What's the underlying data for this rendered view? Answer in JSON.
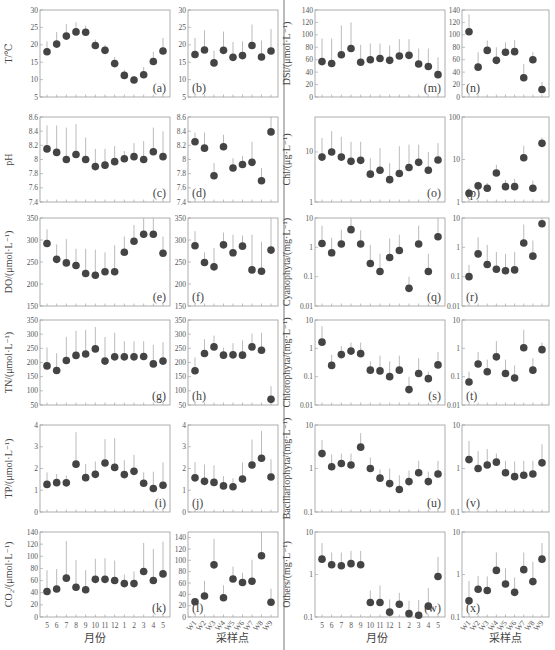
{
  "figure": {
    "left_xlabel": "月份",
    "right_xlabel": "采样点",
    "months": [
      "5",
      "6",
      "7",
      "8",
      "9",
      "10",
      "11",
      "12",
      "1",
      "2",
      "3",
      "4",
      "5"
    ],
    "sites": [
      "W1",
      "W2",
      "W3",
      "W4",
      "W5",
      "W6",
      "W7",
      "W8",
      "W9"
    ]
  },
  "chart_data": [
    {
      "id": "a",
      "type": "scatter",
      "label": "(a)",
      "ylabel": "T/℃",
      "scale": "linear",
      "ylim": [
        5,
        30
      ],
      "yticks": [
        5,
        10,
        15,
        20,
        25,
        30
      ],
      "xaxis": "months",
      "values": [
        18,
        20.2,
        22.5,
        23.7,
        23.6,
        19.8,
        18.4,
        14.6,
        11.2,
        9.9,
        11.4,
        15.2,
        18.2
      ],
      "upper": [
        21,
        23.7,
        26,
        26.5,
        25.5,
        21.5,
        20,
        16.5,
        12.8,
        11,
        13.6,
        18,
        22
      ]
    },
    {
      "id": "b",
      "type": "scatter",
      "label": "(b)",
      "ylabel": "",
      "scale": "linear",
      "ylim": [
        5,
        30
      ],
      "yticks": [
        5,
        10,
        15,
        20,
        25,
        30
      ],
      "xaxis": "sites",
      "values": [
        17.2,
        18.5,
        14.8,
        18.4,
        16.4,
        16.9,
        19.8,
        16.5,
        18.2
      ],
      "upper": [
        22,
        24.2,
        18.3,
        23.8,
        20.8,
        21,
        25.8,
        21.2,
        24.5
      ]
    },
    {
      "id": "c",
      "type": "scatter",
      "label": "(c)",
      "ylabel": "pH",
      "scale": "linear",
      "ylim": [
        7.4,
        8.6
      ],
      "yticks": [
        "7.4",
        "7.6",
        "7.8",
        "8",
        "8.2",
        "8.4",
        "8.6"
      ],
      "xaxis": "months",
      "values": [
        8.15,
        8.1,
        8.0,
        8.07,
        8.0,
        7.9,
        7.92,
        7.97,
        8.01,
        8.04,
        8.0,
        8.11,
        8.04
      ],
      "upper": [
        8.48,
        8.48,
        8.45,
        8.5,
        8.31,
        8.15,
        8.15,
        8.19,
        8.12,
        8.23,
        8.26,
        8.45,
        8.4
      ]
    },
    {
      "id": "d",
      "type": "scatter",
      "label": "(d)",
      "ylabel": "",
      "scale": "linear",
      "ylim": [
        7.4,
        8.6
      ],
      "yticks": [
        "7.4",
        "7.6",
        "7.8",
        "8",
        "8.2",
        "8.4",
        "8.6"
      ],
      "xaxis": "sites",
      "values": [
        8.25,
        8.16,
        7.77,
        8.18,
        7.88,
        7.93,
        7.96,
        7.7,
        8.39
      ],
      "upper": [
        8.38,
        8.38,
        7.95,
        8.35,
        8.02,
        8.05,
        8.25,
        7.88,
        8.6
      ]
    },
    {
      "id": "e",
      "type": "scatter",
      "label": "(e)",
      "ylabel": "DO/(μmol·L⁻¹)",
      "scale": "linear",
      "ylim": [
        150,
        350
      ],
      "yticks": [
        150,
        200,
        250,
        300,
        350
      ],
      "xaxis": "months",
      "values": [
        292,
        256,
        248,
        242,
        224,
        220,
        228,
        228,
        272,
        297,
        313,
        313,
        270
      ],
      "upper": [
        324,
        290,
        302,
        280,
        280,
        278,
        272,
        288,
        308,
        334,
        352,
        360,
        308
      ]
    },
    {
      "id": "f",
      "type": "scatter",
      "label": "(f)",
      "ylabel": "",
      "scale": "linear",
      "ylim": [
        150,
        350
      ],
      "yticks": [
        150,
        200,
        250,
        300,
        350
      ],
      "xaxis": "sites",
      "values": [
        287,
        249,
        239,
        289,
        271,
        286,
        232,
        229,
        277
      ],
      "upper": [
        320,
        272,
        282,
        317,
        312,
        310,
        312,
        296,
        352
      ]
    },
    {
      "id": "g",
      "type": "scatter",
      "label": "(g)",
      "ylabel": "TN/(μmol·L⁻¹)",
      "scale": "linear",
      "ylim": [
        50,
        350
      ],
      "yticks": [
        50,
        100,
        150,
        200,
        250,
        300,
        350
      ],
      "xaxis": "months",
      "values": [
        188,
        172,
        207,
        225,
        230,
        248,
        205,
        220,
        220,
        220,
        221,
        195,
        205
      ],
      "upper": [
        253,
        233,
        290,
        312,
        315,
        325,
        290,
        305,
        275,
        275,
        275,
        262,
        272
      ]
    },
    {
      "id": "h",
      "type": "scatter",
      "label": "(h)",
      "ylabel": "",
      "scale": "linear",
      "ylim": [
        50,
        350
      ],
      "yticks": [
        50,
        100,
        150,
        200,
        250,
        300,
        350
      ],
      "xaxis": "sites",
      "values": [
        171,
        232,
        255,
        226,
        227,
        226,
        255,
        243,
        70
      ],
      "upper": [
        218,
        282,
        295,
        252,
        268,
        278,
        302,
        305,
        116
      ]
    },
    {
      "id": "i",
      "type": "scatter",
      "label": "(i)",
      "ylabel": "TP/(μmol·L⁻¹)",
      "scale": "linear",
      "ylim": [
        0,
        4
      ],
      "yticks": [
        0,
        1,
        2,
        3,
        4
      ],
      "xaxis": "months",
      "values": [
        1.27,
        1.35,
        1.34,
        2.2,
        1.58,
        1.73,
        2.25,
        2.05,
        1.72,
        1.87,
        1.32,
        1.08,
        1.23
      ],
      "upper": [
        1.82,
        1.75,
        1.68,
        3.67,
        2.2,
        2.32,
        3.35,
        3.4,
        2.38,
        2.63,
        1.82,
        1.85,
        2.28
      ]
    },
    {
      "id": "j",
      "type": "scatter",
      "label": "(j)",
      "ylabel": "",
      "scale": "linear",
      "ylim": [
        0,
        4
      ],
      "yticks": [
        0,
        1,
        2,
        3,
        4
      ],
      "xaxis": "sites",
      "values": [
        1.57,
        1.41,
        1.36,
        1.2,
        1.16,
        1.52,
        2.16,
        2.47,
        1.61
      ],
      "upper": [
        2.3,
        2.18,
        2.15,
        1.65,
        1.55,
        2.27,
        3.33,
        3.72,
        2.43
      ]
    },
    {
      "id": "k",
      "type": "scatter",
      "label": "(k)",
      "ylabel": "CO₂/(μmol·L⁻¹)",
      "scale": "linear",
      "ylim": [
        0,
        140
      ],
      "yticks": [
        0,
        20,
        40,
        60,
        80,
        100,
        120,
        140
      ],
      "xaxis": "months",
      "values": [
        42,
        46,
        64,
        49,
        45,
        62,
        62,
        60,
        55,
        55,
        75,
        60,
        71
      ],
      "upper": [
        77,
        79,
        125,
        94,
        77,
        96,
        97,
        93,
        70,
        75,
        122,
        112,
        124
      ]
    },
    {
      "id": "l",
      "type": "scatter",
      "label": "(l)",
      "ylabel": "",
      "scale": "linear",
      "ylim": [
        0,
        150
      ],
      "yticks": [
        0,
        20,
        40,
        60,
        80,
        100,
        120,
        140
      ],
      "xaxis": "sites",
      "values": [
        27,
        37,
        92,
        34,
        67,
        61,
        63,
        108,
        26
      ],
      "upper": [
        33,
        64,
        138,
        56,
        89,
        78,
        101,
        152,
        50
      ]
    },
    {
      "id": "m",
      "type": "scatter",
      "label": "(m)",
      "ylabel": "DSi/(μmol·L⁻¹)",
      "scale": "linear",
      "ylim": [
        0,
        140
      ],
      "yticks": [
        0,
        20,
        40,
        60,
        80,
        100,
        120,
        140
      ],
      "xaxis": "months",
      "values": [
        57,
        54,
        68,
        78,
        56,
        60,
        62,
        59,
        66,
        67,
        53,
        49,
        36
      ],
      "upper": [
        94,
        94,
        115,
        120,
        84,
        86,
        86,
        83,
        93,
        93,
        78,
        78,
        64
      ]
    },
    {
      "id": "n",
      "type": "scatter",
      "label": "(n)",
      "ylabel": "",
      "scale": "linear",
      "ylim": [
        0,
        140
      ],
      "yticks": [
        0,
        20,
        40,
        60,
        80,
        100,
        120,
        140
      ],
      "xaxis": "sites",
      "values": [
        105,
        48,
        75,
        59,
        72,
        73,
        31,
        60,
        12
      ],
      "upper": [
        133,
        72,
        91,
        80,
        88,
        92,
        53,
        72,
        24
      ]
    },
    {
      "id": "o",
      "type": "scatter",
      "label": "(o)",
      "ylabel": "Chl/(μg·L⁻¹)",
      "scale": "log",
      "ylim": [
        1,
        50
      ],
      "yticks": [
        "1",
        "10"
      ],
      "xaxis": "months",
      "values": [
        7.9,
        10,
        7.9,
        6.5,
        6.8,
        3.6,
        4.3,
        2.8,
        3.7,
        4.9,
        6.2,
        4.3,
        6.9
      ],
      "upper": [
        19,
        26,
        20,
        16,
        16,
        7.5,
        12,
        6,
        13,
        14,
        14,
        10,
        15
      ]
    },
    {
      "id": "p",
      "type": "scatter",
      "label": "(p)",
      "ylabel": "",
      "scale": "log",
      "ylim": [
        1,
        100
      ],
      "yticks": [
        "1",
        "10",
        "100"
      ],
      "xaxis": "sites",
      "values": [
        1.6,
        2.4,
        2.1,
        4.8,
        2.3,
        2.3,
        11,
        2.1,
        24
      ],
      "upper": [
        1.9,
        3,
        2.8,
        7.5,
        3.3,
        3.5,
        21,
        3.2,
        33
      ]
    },
    {
      "id": "q",
      "type": "scatter",
      "label": "(q)",
      "ylabel": "Cyanophyta/(mg·L⁻¹)",
      "scale": "log",
      "ylim": [
        0.01,
        10
      ],
      "yticks": [
        "0.01",
        "0.1",
        "1",
        "10"
      ],
      "xaxis": "months",
      "values": [
        1.35,
        0.65,
        1.3,
        4.0,
        1.3,
        0.28,
        0.15,
        0.45,
        0.78,
        0.04,
        1.3,
        0.15,
        2.3
      ],
      "upper": [
        5.5,
        2.1,
        4.0,
        10,
        3.8,
        1.2,
        0.6,
        2.0,
        2.7,
        0.1,
        5.5,
        0.6,
        10
      ]
    },
    {
      "id": "r",
      "type": "scatter",
      "label": "(r)",
      "ylabel": "",
      "scale": "log",
      "ylim": [
        0.01,
        10
      ],
      "yticks": [
        "0.01",
        "0.1",
        "1",
        "10"
      ],
      "xaxis": "sites",
      "values": [
        0.1,
        0.6,
        0.26,
        0.18,
        0.16,
        0.17,
        1.4,
        0.5,
        6.4
      ],
      "upper": [
        0.25,
        2.2,
        1.2,
        0.7,
        0.6,
        0.7,
        6.0,
        1.7,
        10
      ]
    },
    {
      "id": "s",
      "type": "scatter",
      "label": "(s)",
      "ylabel": "Chlorophyta/(mg·L⁻¹)",
      "scale": "log",
      "ylim": [
        0.01,
        10
      ],
      "yticks": [
        "0.01",
        "0.1",
        "1",
        "10"
      ],
      "xaxis": "months",
      "values": [
        1.65,
        0.25,
        0.6,
        0.8,
        0.65,
        0.17,
        0.16,
        0.1,
        0.17,
        0.035,
        0.13,
        0.085,
        0.26
      ],
      "upper": [
        6.0,
        0.6,
        1.2,
        1.6,
        1.6,
        0.35,
        0.55,
        0.35,
        0.55,
        0.1,
        0.45,
        0.15,
        0.75
      ]
    },
    {
      "id": "t",
      "type": "scatter",
      "label": "(t)",
      "ylabel": "",
      "scale": "log",
      "ylim": [
        0.01,
        10
      ],
      "yticks": [
        "0.01",
        "0.1",
        "1",
        "10"
      ],
      "xaxis": "sites",
      "values": [
        0.065,
        0.28,
        0.15,
        0.5,
        0.13,
        0.09,
        1.05,
        0.17,
        0.9
      ],
      "upper": [
        0.15,
        0.75,
        0.4,
        1.8,
        0.4,
        0.25,
        4.5,
        0.45,
        1.6
      ]
    },
    {
      "id": "u",
      "type": "scatter",
      "label": "(u)",
      "ylabel": "Bacillariophyta/(mg·L⁻¹)",
      "scale": "log",
      "ylim": [
        0.1,
        10
      ],
      "yticks": [
        "0.1",
        "1",
        "10"
      ],
      "xaxis": "months",
      "values": [
        2.2,
        1.1,
        1.3,
        1.2,
        3.1,
        1.0,
        0.6,
        0.45,
        0.33,
        0.5,
        0.8,
        0.5,
        0.75
      ],
      "upper": [
        4.5,
        2.1,
        2.2,
        2.2,
        6.5,
        1.8,
        0.95,
        1.0,
        0.7,
        0.9,
        1.5,
        0.85,
        1.5
      ]
    },
    {
      "id": "v",
      "type": "scatter",
      "label": "(v)",
      "ylabel": "",
      "scale": "log",
      "ylim": [
        0.1,
        10
      ],
      "yticks": [
        "0.1",
        "1",
        "10"
      ],
      "xaxis": "sites",
      "values": [
        1.6,
        1.0,
        1.2,
        1.4,
        0.8,
        0.65,
        0.7,
        0.75,
        1.35
      ],
      "upper": [
        4.3,
        2.5,
        2.8,
        2.2,
        1.5,
        1.45,
        1.5,
        1.5,
        3.6
      ]
    },
    {
      "id": "w",
      "type": "scatter",
      "label": "(w)",
      "ylabel": "Others/(mg·L⁻¹)",
      "scale": "log",
      "ylim": [
        0.1,
        10
      ],
      "yticks": [
        "0.1",
        "1",
        "10"
      ],
      "xaxis": "months",
      "values": [
        2.3,
        1.7,
        1.6,
        1.8,
        1.7,
        0.22,
        0.22,
        0.13,
        0.2,
        0.12,
        0.11,
        0.18,
        0.9
      ],
      "upper": [
        5.5,
        3.3,
        3.3,
        3.6,
        3.6,
        0.42,
        0.55,
        0.26,
        0.37,
        0.24,
        0.25,
        0.48,
        2.6
      ]
    },
    {
      "id": "x",
      "type": "scatter",
      "label": "(x)",
      "ylabel": "",
      "scale": "log",
      "ylim": [
        0.1,
        10
      ],
      "yticks": [
        "0.1",
        "1",
        "10"
      ],
      "xaxis": "sites",
      "values": [
        0.24,
        0.45,
        0.42,
        1.25,
        0.6,
        0.38,
        1.3,
        0.68,
        2.3
      ],
      "upper": [
        0.7,
        0.92,
        0.9,
        3.3,
        1.4,
        0.85,
        3.3,
        2.0,
        5.5
      ]
    }
  ]
}
